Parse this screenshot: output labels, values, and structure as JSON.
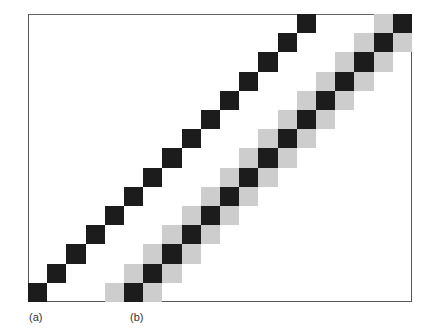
{
  "figure": {
    "labels": [
      {
        "id": "a",
        "text": "(a)"
      },
      {
        "id": "b",
        "text": "(b)"
      }
    ],
    "colors": {
      "frame": "#555555",
      "dark": "#1c1c1c",
      "gray": "#cdcdcd",
      "background": "#ffffff"
    },
    "grid": {
      "origin_x": 28,
      "origin_bottom_y": 302,
      "cell_size": 19.2,
      "steps": 15
    },
    "line_a": {
      "start_col": 0,
      "count": 15,
      "antialiased": false
    },
    "line_b": {
      "start_col": 5,
      "count": 15,
      "antialiased": true,
      "neighbor_shade": "gray"
    }
  }
}
